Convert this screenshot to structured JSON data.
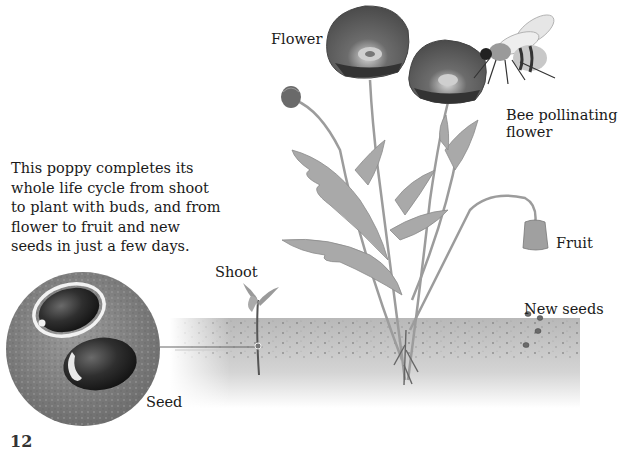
{
  "diagram": {
    "caption_lines": [
      "This poppy completes its",
      "whole life cycle from shoot",
      "to plant with buds, and from",
      "flower to fruit and new",
      "seeds in just a few days."
    ],
    "labels": {
      "flower": "Flower",
      "bee": [
        "Bee pollinating",
        "flower"
      ],
      "fruit": "Fruit",
      "shoot": "Shoot",
      "new_seeds": "New seeds",
      "seed": "Seed"
    },
    "page_number": "12",
    "colors": {
      "background": "#ffffff",
      "soil": "#bdbdbd",
      "seed_disc": "#8a8a8a",
      "seed": "#2e2e2e",
      "petal": "#5a5a5a",
      "leaf": "#a8a8a8",
      "text": "#1a1a1a"
    }
  }
}
